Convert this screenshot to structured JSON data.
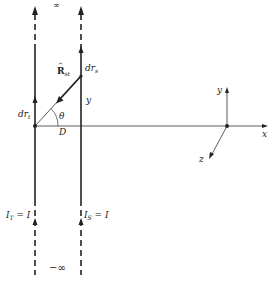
{
  "diagram": {
    "type": "two infinite parallel current-carrying wires with coordinate axes",
    "labels": {
      "infinity_top": "∞",
      "infinity_bottom": "−∞",
      "dr_s": "dr",
      "dr_s_sub": "s",
      "dr_t": "dr",
      "dr_t_sub": "t",
      "R_hat": "R",
      "R_hat_caret": "^",
      "R_hat_sub": "st",
      "theta": "θ",
      "D": "D",
      "y_wire": "y",
      "I_T": "I",
      "I_T_sub": "T",
      "I_T_eq": "= I",
      "I_S": "I",
      "I_S_sub": "S",
      "I_S_eq": "= I",
      "axis_x": "x",
      "axis_y": "y",
      "axis_z": "z"
    },
    "wires": [
      {
        "name": "target wire T",
        "x": 35,
        "current": "I_T = I",
        "direction": "up"
      },
      {
        "name": "source wire S",
        "x": 81,
        "current": "I_S = I",
        "direction": "up"
      }
    ],
    "separation": "D",
    "colors": {
      "line": "#222222",
      "background": "#ffffff"
    }
  }
}
